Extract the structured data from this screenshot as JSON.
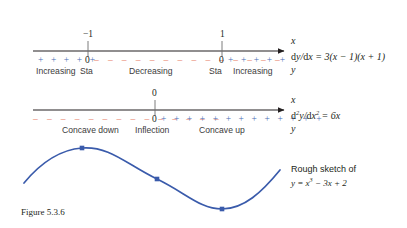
{
  "figure": {
    "caption": "Figure 5.3.6",
    "colors": {
      "positive": "#4a6fb5",
      "negative": "#e8836b",
      "axis": "#231f20",
      "curve": "#3a5bab",
      "text": "#231f20",
      "background": "#ffffff"
    }
  },
  "first_derivative_line": {
    "ticks": [
      {
        "label": "−1",
        "x": 88
      },
      {
        "label": "1",
        "x": 222
      }
    ],
    "zeros": [
      {
        "label": "0",
        "x": 88
      },
      {
        "label": "0",
        "x": 222
      }
    ],
    "sign_segments": [
      {
        "sign": "+",
        "symbols": "+ + + + +",
        "from": 38,
        "to": 84
      },
      {
        "sign": "−",
        "symbols": "– – – – – – – – – – – – – –",
        "from": 95,
        "to": 216
      },
      {
        "sign": "+",
        "symbols": "+ + + + +",
        "from": 228,
        "to": 275
      }
    ],
    "region_labels": [
      {
        "text": "Increasing",
        "x": 38
      },
      {
        "text": "Sta",
        "x": 80
      },
      {
        "text": "Decreasing",
        "x": 129
      },
      {
        "text": "Sta",
        "x": 212
      },
      {
        "text": "Increasing",
        "x": 236
      }
    ],
    "axis_var_top": "x",
    "axis_var_bottom": "y",
    "formula_html": "dy/dx = 3(x − 1)(x + 1)",
    "formula_text": "dy/dx = 3(x - 1)(x + 1)"
  },
  "second_derivative_line": {
    "ticks": [
      {
        "label": "0",
        "x": 155
      }
    ],
    "zeros": [
      {
        "label": "0",
        "x": 155
      }
    ],
    "sign_segments": [
      {
        "sign": "−",
        "symbols": "– – – – – – – – – – – – – –",
        "from": 33,
        "to": 149
      },
      {
        "sign": "+",
        "symbols": "+ + + + + + + + + + + + +",
        "from": 161,
        "to": 275
      }
    ],
    "region_labels": [
      {
        "text": "Concave down",
        "x": 64
      },
      {
        "text": "Inflection",
        "x": 136
      },
      {
        "text": "Concave up",
        "x": 200
      }
    ],
    "axis_var_top": "x",
    "axis_var_bottom": "y",
    "formula_text": "d2y/dx2 = 6x"
  },
  "sketch": {
    "note_line1": "Rough sketch of",
    "note_line2_text": "y = x3 − 3x + 2",
    "points": [
      {
        "name": "maximum",
        "x": 82,
        "y": 148
      },
      {
        "name": "inflection",
        "x": 157,
        "y": 179
      },
      {
        "name": "minimum",
        "x": 222,
        "y": 209
      }
    ],
    "curve_path": "M 24,183 C 38,166 56,150 82,148 C 110,146 126,164 157,179 C 186,193 200,209 222,209 C 244,209 262,192 280,170"
  }
}
